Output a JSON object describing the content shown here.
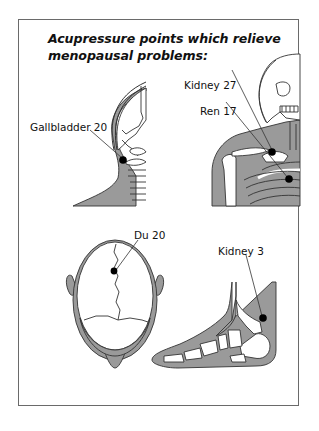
{
  "title": {
    "line1": "Acupressure points which relieve",
    "line2": "menopausal problems:"
  },
  "points": [
    {
      "name": "Gallbladder 20",
      "figure": "side-of-head"
    },
    {
      "name": "Kidney 27",
      "figure": "upper-torso-skeleton"
    },
    {
      "name": "Ren 17",
      "figure": "upper-torso-skeleton"
    },
    {
      "name": "Du 20",
      "figure": "top-of-head"
    },
    {
      "name": "Kidney 3",
      "figure": "foot"
    }
  ],
  "colors": {
    "tissue": "#9a9a9a",
    "outline": "#333333",
    "point": "#000000",
    "frame": "#6a6a6a"
  }
}
